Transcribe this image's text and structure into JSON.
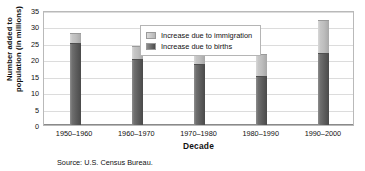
{
  "chart_data": {
    "type": "bar",
    "stacked": true,
    "title": "",
    "xlabel": "Decade",
    "ylabel": "Number added to population (in millions)",
    "ylabel_line1": "Number added to",
    "ylabel_line2": "population (in millions)",
    "categories": [
      "1950–1960",
      "1960–1970",
      "1970–1980",
      "1980–1990",
      "1990–2000"
    ],
    "series": [
      {
        "name": "Increase due to births",
        "values": [
          25,
          20,
          18.5,
          15,
          22
        ],
        "color": "#5e5e5e"
      },
      {
        "name": "Increase due to immigration",
        "values": [
          3,
          4,
          4,
          6.5,
          10
        ],
        "color": "#c2c2c2"
      }
    ],
    "totals": [
      28,
      24,
      22.5,
      21.5,
      32
    ],
    "ylim": [
      0,
      35
    ],
    "ytick_values": [
      0,
      5,
      10,
      15,
      20,
      25,
      30,
      35
    ],
    "ytick_labels": [
      "0",
      "5",
      "10",
      "15",
      "20",
      "25",
      "30",
      "35"
    ],
    "grid": true,
    "grid_axis": "y",
    "legend_position": "top-center-inside",
    "legend_entries": [
      "Increase due to immigration",
      "Increase due to births"
    ]
  },
  "source": {
    "text": "Source: U.S. Census Bureau."
  },
  "colors": {
    "births": "#5e5e5e",
    "immigration": "#c2c2c2",
    "grid": "#dcdcdc",
    "axis": "#b9b9b9",
    "text": "#111111",
    "background": "#ffffff"
  }
}
